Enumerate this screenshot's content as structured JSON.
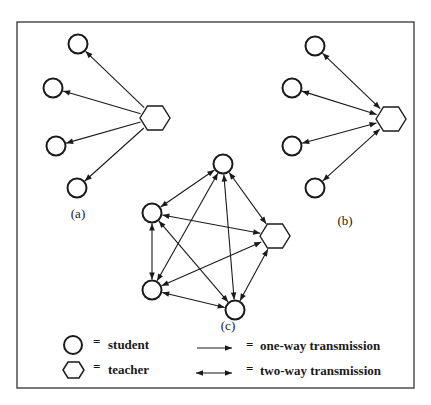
{
  "figure": {
    "frame": {
      "x": 17,
      "y": 22,
      "width": 397,
      "height": 366
    },
    "colors": {
      "stroke": "#1a1a1a",
      "background": "#ffffff"
    }
  },
  "diagrams": [
    {
      "id": "a",
      "label": "(a)",
      "label_pos": [
        78,
        218
      ],
      "mode": "one-way",
      "teacher": [
        155,
        118
      ],
      "students": [
        [
          78,
          44
        ],
        [
          53,
          88
        ],
        [
          56,
          146
        ],
        [
          77,
          188
        ]
      ]
    },
    {
      "id": "b",
      "label": "(b)",
      "label_pos": [
        345,
        225
      ],
      "mode": "two-way",
      "teacher": [
        391,
        119
      ],
      "students": [
        [
          315,
          46
        ],
        [
          292,
          88
        ],
        [
          292,
          146
        ],
        [
          315,
          188
        ]
      ]
    },
    {
      "id": "c",
      "label": "(c)",
      "label_pos": [
        228,
        330
      ],
      "mode": "two-way-complete",
      "teacher": [
        275,
        236
      ],
      "students": [
        [
          223,
          164
        ],
        [
          152,
          213
        ],
        [
          152,
          290
        ],
        [
          235,
          310
        ]
      ]
    }
  ],
  "legend": {
    "items": [
      {
        "symbol": "circle",
        "label": "student"
      },
      {
        "symbol": "hexagon",
        "label": "teacher"
      },
      {
        "symbol": "one-way-arrow",
        "label": "one-way transmission"
      },
      {
        "symbol": "two-way-arrow",
        "label": "two-way transmission"
      }
    ],
    "equals": "="
  }
}
